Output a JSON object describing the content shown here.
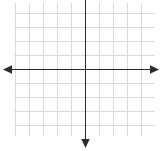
{
  "figure": {
    "title": ""
  },
  "chart_data": {
    "type": "line",
    "title": "",
    "xlabel": "",
    "ylabel": "",
    "series": [],
    "x": [],
    "values": [],
    "categories": [],
    "xlim": [
      -5,
      5
    ],
    "ylim": [
      -5,
      5
    ],
    "xticks": [
      -5,
      -4,
      -3,
      -2,
      -1,
      0,
      1,
      2,
      3,
      4,
      5
    ],
    "yticks": [
      -5,
      -4,
      -3,
      -2,
      -1,
      0,
      1,
      2,
      3,
      4,
      5
    ],
    "xtick_labels": [],
    "ytick_labels": [],
    "grid": true,
    "legend": null,
    "annotations": [],
    "axis_style": {
      "x_axis_arrows": "both",
      "y_axis_arrows": "down",
      "origin_px": [
        85,
        69
      ],
      "cell_size_px": 14.1,
      "grid_columns": 10,
      "grid_rows": 9.5
    },
    "colors": {
      "grid": "#d9d9d9",
      "axis": "#2b2b2b",
      "background": "#ffffff"
    }
  },
  "geometry": {
    "width": 162,
    "height": 151,
    "grid_left": 14,
    "grid_right": 155,
    "grid_top": 3,
    "grid_bottom": 136,
    "origin_x": 85,
    "origin_y": 69,
    "cell": 14.1,
    "x_axis_start": 3,
    "x_axis_end": 159,
    "y_axis_top": 0,
    "y_axis_end": 148
  }
}
